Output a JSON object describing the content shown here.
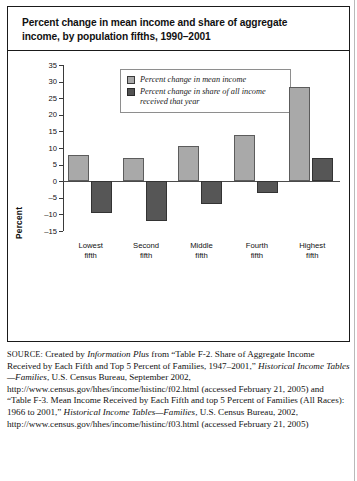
{
  "figure": {
    "title_line1": "Percent change in mean income and share of aggregate",
    "title_line2": "income, by population fifths, 1990–2001"
  },
  "legend": {
    "items": [
      {
        "label": "Percent change in mean income",
        "color": "#a9a9a9"
      },
      {
        "label": "Percent change in share of all income received that year",
        "color": "#565656"
      }
    ]
  },
  "chart_data": {
    "type": "bar",
    "title": "Percent change in mean income and share of aggregate income, by population fifths, 1990–2001",
    "xlabel": "",
    "ylabel": "Percent",
    "categories": [
      "Lowest fifth",
      "Second fifth",
      "Middle fifth",
      "Fourth fifth",
      "Highest fifth"
    ],
    "category_lines": [
      [
        "Lowest",
        "fifth"
      ],
      [
        "Second",
        "fifth"
      ],
      [
        "Middle",
        "fifth"
      ],
      [
        "Fourth",
        "fifth"
      ],
      [
        "Highest",
        "fifth"
      ]
    ],
    "series": [
      {
        "name": "Percent change in mean income",
        "color": "#a9a9a9",
        "values": [
          8,
          7,
          10.5,
          14,
          28.5
        ]
      },
      {
        "name": "Percent change in share of all income received that year",
        "color": "#565656",
        "values": [
          -9.5,
          -12,
          -7,
          -3.5,
          7
        ]
      }
    ],
    "ylim": [
      -15,
      35
    ],
    "ytick_step": 5,
    "yticks": [
      35,
      30,
      25,
      20,
      15,
      10,
      5,
      0,
      -5,
      -10,
      -15
    ],
    "ytick_labels": [
      "35",
      "30",
      "25",
      "20",
      "15",
      "10",
      "5",
      "0",
      "–5",
      "–10",
      "–15"
    ],
    "grid": false,
    "legend_position": "top-center"
  },
  "source": {
    "tag": "SOURCE:",
    "text_parts": [
      {
        "t": " Created by ",
        "style": "normal"
      },
      {
        "t": "Information Plus",
        "style": "italic"
      },
      {
        "t": " from “Table F-2. Share of Aggregate Income Received by Each Fifth and Top 5 Percent of Families, 1947–2001,” ",
        "style": "normal"
      },
      {
        "t": "Historical Income Tables—Families",
        "style": "italic"
      },
      {
        "t": ", U.S. Census Bureau, September 2002, http://www.census.gov/hhes/income/histinc/f02.html (accessed February 21, 2005) and “Table F-3. Mean Income Received by Each Fifth and top 5 Percent of Families (All Races): 1966 to 2001,” ",
        "style": "normal"
      },
      {
        "t": "Historical Income Tables—Families",
        "style": "italic"
      },
      {
        "t": ", U.S. Census Bureau, 2002, http://www.census.gov/hhes/income/histinc/f03.html (accessed February 21, 2005)",
        "style": "normal"
      }
    ]
  }
}
